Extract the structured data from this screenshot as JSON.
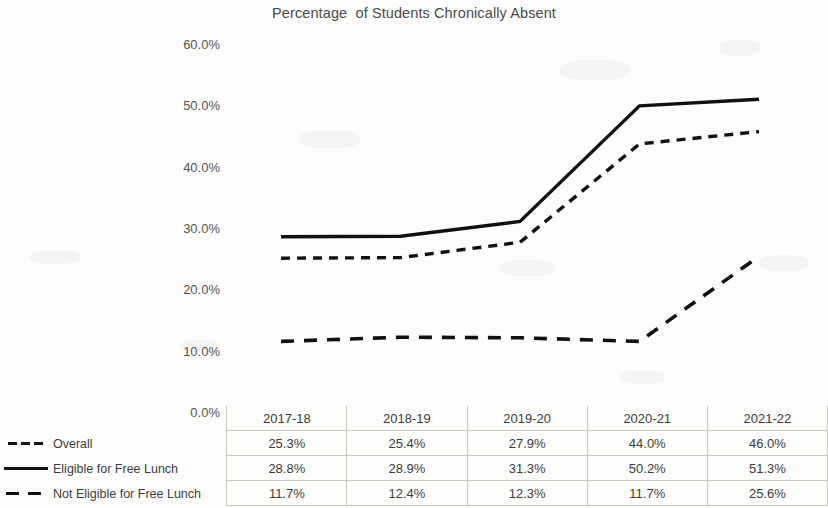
{
  "chart_data": {
    "type": "line",
    "title": "Percentage  of Students Chronically Absent",
    "xlabel": "",
    "ylabel": "",
    "ylim": [
      0,
      60
    ],
    "yticks": [
      "0.0%",
      "10.0%",
      "20.0%",
      "30.0%",
      "40.0%",
      "50.0%",
      "60.0%"
    ],
    "ytick_values": [
      0,
      10,
      20,
      30,
      40,
      50,
      60
    ],
    "grid": false,
    "legend_position": "table-left",
    "categories": [
      "2017-18",
      "2018-19",
      "2019-20",
      "2020-21",
      "2021-22"
    ],
    "series": [
      {
        "name": "Overall",
        "style": "dashed-short",
        "color": "#111111",
        "values": [
          25.3,
          25.4,
          27.9,
          44.0,
          46.0
        ],
        "labels": [
          "25.3%",
          "25.4%",
          "27.9%",
          "44.0%",
          "46.0%"
        ]
      },
      {
        "name": "Eligible for Free Lunch",
        "style": "solid",
        "color": "#111111",
        "values": [
          28.8,
          28.9,
          31.3,
          50.2,
          51.3
        ],
        "labels": [
          "28.8%",
          "28.9%",
          "31.3%",
          "50.2%",
          "51.3%"
        ]
      },
      {
        "name": "Not Eligible for Free Lunch",
        "style": "dashed-long",
        "color": "#111111",
        "values": [
          11.7,
          12.4,
          12.3,
          11.7,
          25.6
        ],
        "labels": [
          "11.7%",
          "12.4%",
          "12.3%",
          "11.7%",
          "25.6%"
        ]
      }
    ]
  },
  "table": {
    "header": [
      "2017-18",
      "2018-19",
      "2019-20",
      "2020-21",
      "2021-22"
    ],
    "rows": [
      {
        "label": "Overall",
        "values": [
          "25.3%",
          "25.4%",
          "27.9%",
          "44.0%",
          "46.0%"
        ]
      },
      {
        "label": "Eligible for Free Lunch",
        "values": [
          "28.8%",
          "28.9%",
          "31.3%",
          "50.2%",
          "51.3%"
        ]
      },
      {
        "label": "Not Eligible for Free Lunch",
        "values": [
          "11.7%",
          "12.4%",
          "12.3%",
          "11.7%",
          "25.6%"
        ]
      }
    ]
  },
  "axis": {
    "y0": "0.0%",
    "y1": "10.0%",
    "y2": "20.0%",
    "y3": "30.0%",
    "y4": "40.0%",
    "y5": "50.0%",
    "y6": "60.0%"
  }
}
